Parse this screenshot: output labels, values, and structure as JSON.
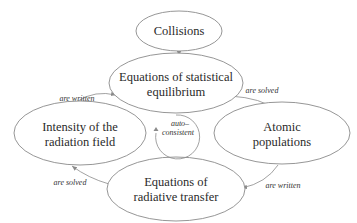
{
  "diagram": {
    "nodes": {
      "collisions": {
        "lines": [
          "Collisions"
        ]
      },
      "statistical_equilibrium": {
        "lines": [
          "Equations of statistical",
          "equilibrium"
        ]
      },
      "radiation_intensity": {
        "lines": [
          "Intensity of the",
          "radiation field"
        ]
      },
      "atomic_populations": {
        "lines": [
          "Atomic",
          "populations"
        ]
      },
      "radiative_transfer": {
        "lines": [
          "Equations of",
          "radiative transfer"
        ]
      }
    },
    "edges": {
      "collisions_to_equilibrium": {
        "label": ""
      },
      "equilibrium_to_populations": {
        "label": "are solved"
      },
      "populations_to_transfer": {
        "label": "are written"
      },
      "transfer_to_intensity": {
        "label": "are solved"
      },
      "intensity_to_equilibrium": {
        "label": "are written"
      }
    },
    "center_loop": {
      "lines": [
        "auto–",
        "consistent"
      ]
    }
  },
  "colors": {
    "stroke": "#8a8a8a",
    "text": "#2a2a2a",
    "background": "#ffffff"
  }
}
